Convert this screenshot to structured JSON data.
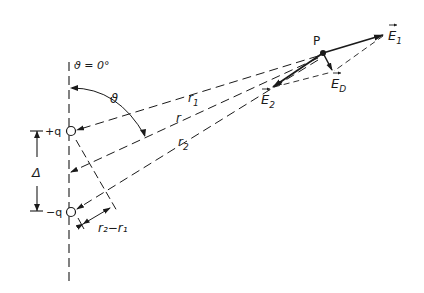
{
  "diagram": {
    "type": "electric-dipole-field",
    "axis_label": "ϑ = 0°",
    "angle_label": "ϑ",
    "charges": {
      "positive": "+q",
      "negative": "−q",
      "separation": "Δ"
    },
    "distances": {
      "r1": "r",
      "r1_sub": "1",
      "r": "r",
      "r2": "r",
      "r2_sub": "2",
      "path_difference": "r₂−r₁"
    },
    "point": "P",
    "vectors": {
      "E1": {
        "label": "E",
        "sub": "1"
      },
      "E2": {
        "label": "E",
        "sub": "2"
      },
      "ED": {
        "label": "E",
        "sub": "D"
      }
    },
    "colors": {
      "line": "#1a1a1a",
      "background": "#ffffff"
    }
  }
}
